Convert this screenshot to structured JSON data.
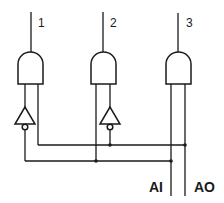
{
  "diagram": {
    "type": "logic-decoder-circuit",
    "outputs": [
      {
        "label": "1"
      },
      {
        "label": "2"
      },
      {
        "label": "3"
      }
    ],
    "inputs": [
      {
        "label": "AI"
      },
      {
        "label": "AO"
      }
    ],
    "components": {
      "and_gates": 3,
      "inverters": 2,
      "junction_dots": 4
    },
    "colors": {
      "line": "#1a1a1a",
      "background": "#ffffff"
    }
  }
}
